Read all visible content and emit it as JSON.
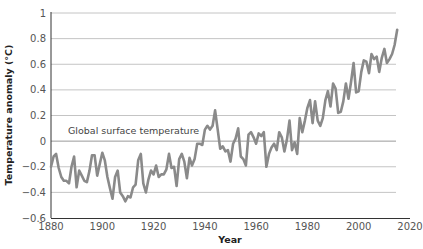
{
  "chart_data": {
    "type": "line",
    "title": "",
    "xlabel": "Year",
    "ylabel": "Temperature anomaly (°C)",
    "xlim": [
      1880,
      2020
    ],
    "ylim": [
      -0.6,
      1
    ],
    "x_ticks": [
      "1880",
      "1900",
      "1920",
      "1940",
      "1960",
      "1980",
      "2000",
      "2020"
    ],
    "y_ticks": [
      "1",
      "0.8",
      "0.6",
      "0.4",
      "0.2",
      "0",
      "−0.2",
      "−0.4",
      "−0.6"
    ],
    "grid": "horizontal",
    "legend": null,
    "annotations": [
      {
        "text": "Global surface temperature",
        "x": 1882,
        "y": 0.05
      }
    ],
    "line_color": "#8a8a8a",
    "series": [
      {
        "name": "Global surface temperature",
        "x": [
          1880,
          1881,
          1882,
          1883,
          1884,
          1885,
          1886,
          1887,
          1888,
          1889,
          1890,
          1891,
          1892,
          1893,
          1894,
          1895,
          1896,
          1897,
          1898,
          1899,
          1900,
          1901,
          1902,
          1903,
          1904,
          1905,
          1906,
          1907,
          1908,
          1909,
          1910,
          1911,
          1912,
          1913,
          1914,
          1915,
          1916,
          1917,
          1918,
          1919,
          1920,
          1921,
          1922,
          1923,
          1924,
          1925,
          1926,
          1927,
          1928,
          1929,
          1930,
          1931,
          1932,
          1933,
          1934,
          1935,
          1936,
          1937,
          1938,
          1939,
          1940,
          1941,
          1942,
          1943,
          1944,
          1945,
          1946,
          1947,
          1948,
          1949,
          1950,
          1951,
          1952,
          1953,
          1954,
          1955,
          1956,
          1957,
          1958,
          1959,
          1960,
          1961,
          1962,
          1963,
          1964,
          1965,
          1966,
          1967,
          1968,
          1969,
          1970,
          1971,
          1972,
          1973,
          1974,
          1975,
          1976,
          1977,
          1978,
          1979,
          1980,
          1981,
          1982,
          1983,
          1984,
          1985,
          1986,
          1987,
          1988,
          1989,
          1990,
          1991,
          1992,
          1993,
          1994,
          1995,
          1996,
          1997,
          1998,
          1999,
          2000,
          2001,
          2002,
          2003,
          2004,
          2005,
          2006,
          2007,
          2008,
          2009,
          2010,
          2011,
          2012,
          2013,
          2014,
          2015
        ],
        "values": [
          -0.2,
          -0.12,
          -0.1,
          -0.21,
          -0.28,
          -0.31,
          -0.31,
          -0.33,
          -0.2,
          -0.12,
          -0.36,
          -0.23,
          -0.27,
          -0.31,
          -0.32,
          -0.23,
          -0.11,
          -0.11,
          -0.27,
          -0.18,
          -0.09,
          -0.15,
          -0.28,
          -0.37,
          -0.45,
          -0.28,
          -0.23,
          -0.4,
          -0.43,
          -0.47,
          -0.43,
          -0.44,
          -0.36,
          -0.34,
          -0.15,
          -0.1,
          -0.33,
          -0.4,
          -0.3,
          -0.23,
          -0.26,
          -0.19,
          -0.28,
          -0.26,
          -0.26,
          -0.22,
          -0.1,
          -0.21,
          -0.2,
          -0.35,
          -0.14,
          -0.1,
          -0.16,
          -0.29,
          -0.13,
          -0.19,
          -0.14,
          -0.02,
          -0.02,
          -0.03,
          0.09,
          0.12,
          0.09,
          0.12,
          0.24,
          0.09,
          -0.06,
          -0.04,
          -0.08,
          -0.07,
          -0.16,
          -0.02,
          0.02,
          0.1,
          -0.12,
          -0.14,
          -0.19,
          0.05,
          0.07,
          0.03,
          -0.02,
          0.06,
          0.04,
          0.07,
          -0.2,
          -0.1,
          -0.05,
          -0.02,
          -0.07,
          0.07,
          0.03,
          -0.08,
          0.01,
          0.16,
          -0.07,
          -0.01,
          -0.1,
          0.18,
          0.07,
          0.16,
          0.26,
          0.32,
          0.14,
          0.31,
          0.16,
          0.12,
          0.18,
          0.32,
          0.39,
          0.27,
          0.45,
          0.41,
          0.22,
          0.23,
          0.31,
          0.45,
          0.33,
          0.46,
          0.61,
          0.38,
          0.39,
          0.54,
          0.63,
          0.62,
          0.53,
          0.68,
          0.64,
          0.66,
          0.54,
          0.65,
          0.72,
          0.61,
          0.64,
          0.68,
          0.75,
          0.87
        ]
      }
    ]
  }
}
